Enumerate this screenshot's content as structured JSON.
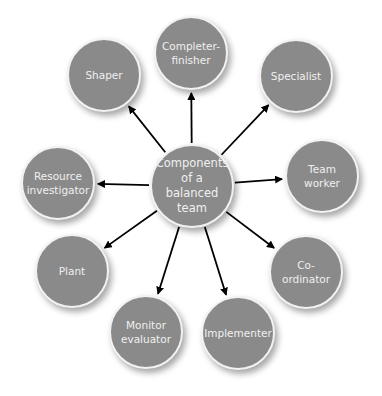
{
  "diagram": {
    "center": {
      "label": "Components\nof a balanced\nteam",
      "x": 192,
      "y": 186,
      "r": 42
    },
    "nodes": [
      {
        "id": "completer-finisher",
        "label": "Completer-\nfinisher",
        "x": 191,
        "y": 53,
        "r": 37
      },
      {
        "id": "specialist",
        "label": "Specialist",
        "x": 296,
        "y": 76,
        "r": 37
      },
      {
        "id": "team-worker",
        "label": "Team\nworker",
        "x": 322,
        "y": 176,
        "r": 37
      },
      {
        "id": "co-ordinator",
        "label": "Co-ordinator",
        "x": 306,
        "y": 272,
        "r": 37
      },
      {
        "id": "implementer",
        "label": "Implementer",
        "x": 238,
        "y": 333,
        "r": 37
      },
      {
        "id": "monitor-evaluator",
        "label": "Monitor\nevaluator",
        "x": 146,
        "y": 332,
        "r": 37
      },
      {
        "id": "plant",
        "label": "Plant",
        "x": 72,
        "y": 271,
        "r": 37
      },
      {
        "id": "resource-investigator",
        "label": "Resource\ninvestigator",
        "x": 58,
        "y": 183,
        "r": 37
      },
      {
        "id": "shaper",
        "label": "Shaper",
        "x": 104,
        "y": 75,
        "r": 37
      }
    ],
    "colors": {
      "node_fill": "#8a8a8a",
      "node_border": "#f2f2f2",
      "text": "#f0f0f0",
      "arrow": "#000000"
    }
  }
}
